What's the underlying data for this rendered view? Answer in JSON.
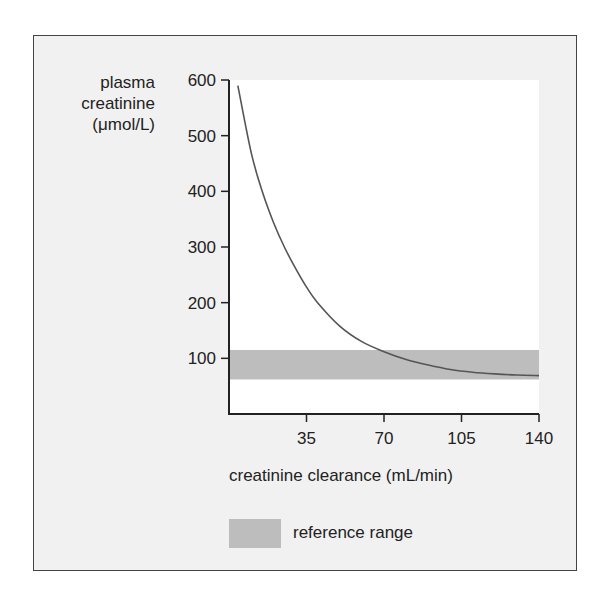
{
  "chart_data": {
    "type": "line",
    "title": "",
    "xlabel": "creatinine clearance (mL/min)",
    "ylabel": [
      "plasma",
      "creatinine",
      "(μmol/L)"
    ],
    "xlim": [
      0,
      140
    ],
    "ylim": [
      0,
      600
    ],
    "x_ticks": [
      35,
      70,
      105,
      140
    ],
    "y_ticks": [
      100,
      200,
      300,
      400,
      500,
      600
    ],
    "grid": false,
    "series": [
      {
        "name": "plasma creatinine",
        "x": [
          4,
          10,
          15,
          20,
          25,
          30,
          35,
          40,
          50,
          60,
          70,
          80,
          90,
          100,
          110,
          120,
          130,
          140
        ],
        "values": [
          590,
          470,
          400,
          345,
          300,
          262,
          228,
          200,
          158,
          130,
          112,
          98,
          88,
          80,
          75,
          72,
          70,
          69
        ]
      }
    ],
    "bands": [
      {
        "name": "reference range",
        "y_min": 62,
        "y_max": 115,
        "color": "#bdbdbd"
      }
    ],
    "legend": {
      "entries": [
        "reference range"
      ],
      "position": "bottom"
    }
  },
  "labels": {
    "y_line1": "plasma",
    "y_line2": "creatinine",
    "y_line3": "(μmol/L)",
    "x_axis": "creatinine clearance (mL/min)",
    "legend": "reference range",
    "y_ticks": [
      "600",
      "500",
      "400",
      "300",
      "200",
      "100"
    ],
    "x_ticks": [
      "35",
      "70",
      "105",
      "140"
    ]
  },
  "colors": {
    "panel_bg": "#f1f1f1",
    "plot_bg": "#ffffff",
    "band": "#bdbdbd",
    "curve": "#555555",
    "axis": "#222222"
  }
}
